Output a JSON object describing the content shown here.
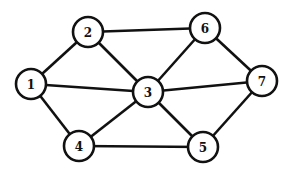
{
  "diagram": {
    "type": "undirected-graph",
    "colors": {
      "stroke": "#111111",
      "node_fill": "#ffffff",
      "background": "#ffffff"
    },
    "node_radius": 15,
    "nodes": [
      {
        "id": "1",
        "label": "1",
        "x": 31,
        "y": 84
      },
      {
        "id": "2",
        "label": "2",
        "x": 88,
        "y": 32
      },
      {
        "id": "3",
        "label": "3",
        "x": 148,
        "y": 92
      },
      {
        "id": "4",
        "label": "4",
        "x": 79,
        "y": 146
      },
      {
        "id": "5",
        "label": "5",
        "x": 203,
        "y": 147
      },
      {
        "id": "6",
        "label": "6",
        "x": 205,
        "y": 28
      },
      {
        "id": "7",
        "label": "7",
        "x": 262,
        "y": 81
      }
    ],
    "edges": [
      [
        "1",
        "2"
      ],
      [
        "1",
        "3"
      ],
      [
        "1",
        "4"
      ],
      [
        "2",
        "3"
      ],
      [
        "2",
        "6"
      ],
      [
        "3",
        "6"
      ],
      [
        "3",
        "7"
      ],
      [
        "3",
        "4"
      ],
      [
        "3",
        "5"
      ],
      [
        "6",
        "7"
      ],
      [
        "5",
        "7"
      ],
      [
        "4",
        "5"
      ]
    ]
  }
}
